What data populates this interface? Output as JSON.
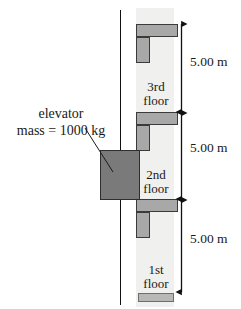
{
  "figure": {
    "type": "physics-diagram"
  },
  "callout": {
    "line1": "elevator",
    "line2": "mass = 1000 kg"
  },
  "floors": [
    {
      "id": "third",
      "line1": "3rd",
      "line2": "floor"
    },
    {
      "id": "second",
      "line1": "2nd",
      "line2": "floor"
    },
    {
      "id": "first",
      "line1": "1st",
      "line2": "floor"
    }
  ],
  "dimensions": [
    {
      "id": "third-to-roof",
      "label": "5.00 m"
    },
    {
      "id": "second-to-third",
      "label": "5.00 m"
    },
    {
      "id": "first-to-second",
      "label": "5.00 m"
    }
  ],
  "colors": {
    "shaft": "#f0f0ee",
    "slab": "#a8a8a8",
    "slab_outline": "#3a3a3a",
    "car": "#7a7a7a",
    "car_outline": "#2e2e2e",
    "line": "#111111",
    "text": "#1a1a1a"
  }
}
